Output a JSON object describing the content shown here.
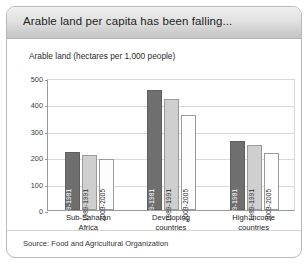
{
  "header": {
    "title": "Arable land per capita has been falling..."
  },
  "subtitle": "Arable land (hectares per 1,000 people)",
  "source": "Source: Food and Agricultural Organization",
  "colors": {
    "series_1979_1981": "#6f6f6f",
    "series_1989_1991": "#cfcfcf",
    "series_2003_2005": "#fdfdfd",
    "header_band": "#dcdcdc",
    "gridline": "#d9d9d9",
    "axis": "#9a9a9a"
  },
  "chart_data": {
    "type": "bar",
    "title": "Arable land per capita has been falling...",
    "subtitle": "Arable land (hectares per 1,000 people)",
    "xlabel": "",
    "ylabel": "Arable land (hectares per 1,000 people)",
    "ylim": [
      0,
      500
    ],
    "yticks": [
      0,
      100,
      200,
      300,
      400,
      500
    ],
    "grid": true,
    "legend": "in-bar rotated labels",
    "categories": [
      "Sub-Saharan Africa",
      "Developing countries",
      "High-income countries"
    ],
    "category_lines": [
      [
        "Sub-Saharan",
        "Africa"
      ],
      [
        "Developing",
        "countries"
      ],
      [
        "High-income",
        "countries"
      ]
    ],
    "series": [
      {
        "name": "1979-1981",
        "values": [
          218,
          455,
          260
        ]
      },
      {
        "name": "1989-1991",
        "values": [
          210,
          420,
          248
        ]
      },
      {
        "name": "2003-2005",
        "values": [
          195,
          360,
          215
        ]
      }
    ]
  }
}
